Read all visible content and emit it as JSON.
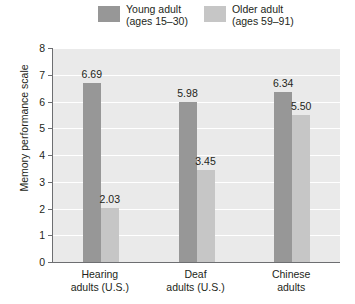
{
  "chart_data": {
    "type": "bar",
    "title": "",
    "xlabel": "",
    "ylabel": "Memory performance scale",
    "ylim": [
      0,
      8
    ],
    "yticks": [
      "0",
      "1",
      "2",
      "3",
      "4",
      "5",
      "6",
      "7",
      "8"
    ],
    "grid": true,
    "legend_position": "top",
    "categories": [
      "Hearing\nadults (U.S.)",
      "Deaf\nadults (U.S.)",
      "Chinese\nadults"
    ],
    "category_lines": [
      [
        "Hearing",
        "adults (U.S.)"
      ],
      [
        "Deaf",
        "adults (U.S.)"
      ],
      [
        "Chinese",
        "adults"
      ]
    ],
    "series": [
      {
        "name": "Young adult",
        "sub": "(ages 15–30)",
        "color": "#979797",
        "values": [
          6.69,
          5.98,
          6.34
        ],
        "labels": [
          "6.69",
          "5.98",
          "6.34"
        ]
      },
      {
        "name": "Older adult",
        "sub": "(ages 59–91)",
        "color": "#c6c6c6",
        "values": [
          2.03,
          3.45,
          5.5
        ],
        "labels": [
          "2.03",
          "3.45",
          "5.50"
        ]
      }
    ]
  },
  "colors": {
    "plot_background": "#eaeaea",
    "gridline": "#ffffff",
    "axis": "#6d6e71",
    "text": "#231f20",
    "young_adult": "#979797",
    "older_adult": "#c6c6c6"
  }
}
